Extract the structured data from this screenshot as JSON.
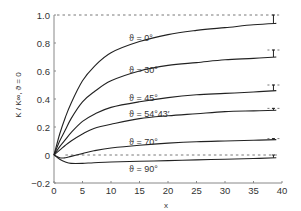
{
  "chart_data": {
    "type": "line",
    "title": "",
    "xlabel": "x",
    "ylabel": "K / K∞, ϑ = 0",
    "xlim": [
      0,
      40
    ],
    "ylim": [
      -0.2,
      1.0
    ],
    "xticks": [
      0,
      5,
      10,
      15,
      20,
      25,
      30,
      35,
      40
    ],
    "xtick_labels": [
      "0",
      "5",
      "10",
      "15",
      "20",
      "25",
      "30",
      "35",
      "40"
    ],
    "yticks": [
      -0.2,
      0,
      0.2,
      0.4,
      0.6,
      0.8,
      1.0
    ],
    "ytick_labels": [
      "−0.2",
      "0",
      "0.2",
      "0.4",
      "0.6",
      "0.8",
      "1.0"
    ],
    "grid": false,
    "legend": "inline labels",
    "reference_lines": [
      {
        "y": 1.0,
        "style": "dashed"
      },
      {
        "y": 0.0,
        "style": "dashed",
        "x_start": 2
      }
    ],
    "series": [
      {
        "name": "ϑ = 0°",
        "label": "ϑ = 0°",
        "asymptote": 1.0,
        "x": [
          0,
          1,
          2,
          3,
          5,
          7,
          10,
          15,
          20,
          25,
          30,
          35,
          39
        ],
        "y": [
          0,
          0.15,
          0.27,
          0.37,
          0.53,
          0.63,
          0.73,
          0.81,
          0.86,
          0.89,
          0.91,
          0.93,
          0.94
        ]
      },
      {
        "name": "ϑ = 30°",
        "label": "ϑ = 30°",
        "asymptote": 0.75,
        "x": [
          0,
          1,
          2,
          3,
          5,
          7,
          10,
          15,
          20,
          25,
          30,
          35,
          39
        ],
        "y": [
          0,
          0.1,
          0.18,
          0.26,
          0.38,
          0.45,
          0.53,
          0.6,
          0.64,
          0.66,
          0.68,
          0.69,
          0.7
        ]
      },
      {
        "name": "ϑ = 45°",
        "label": "ϑ = 45°",
        "asymptote": 0.5,
        "x": [
          0,
          1,
          2,
          3,
          5,
          7,
          10,
          15,
          20,
          25,
          30,
          35,
          39
        ],
        "y": [
          0,
          0.06,
          0.11,
          0.16,
          0.24,
          0.29,
          0.34,
          0.38,
          0.41,
          0.43,
          0.44,
          0.45,
          0.46
        ]
      },
      {
        "name": "ϑ = 54°43′",
        "label": "ϑ = 54°43′",
        "asymptote": 0.333,
        "x": [
          0,
          1,
          2,
          3,
          5,
          7,
          10,
          15,
          20,
          25,
          30,
          35,
          39
        ],
        "y": [
          0,
          0.035,
          0.07,
          0.1,
          0.15,
          0.19,
          0.22,
          0.26,
          0.28,
          0.295,
          0.31,
          0.315,
          0.32
        ]
      },
      {
        "name": "ϑ = 70°",
        "label": "ϑ = 70°",
        "asymptote": 0.117,
        "x": [
          0,
          1,
          2,
          3,
          5,
          7,
          10,
          15,
          20,
          25,
          30,
          35,
          39
        ],
        "y": [
          0,
          -0.02,
          -0.02,
          -0.01,
          0.01,
          0.03,
          0.05,
          0.07,
          0.085,
          0.095,
          0.1,
          0.105,
          0.11
        ]
      },
      {
        "name": "ϑ = 90°",
        "label": "ϑ = 90°",
        "asymptote": 0.0,
        "x": [
          0,
          1,
          2,
          3,
          5,
          7,
          10,
          15,
          20,
          25,
          30,
          35,
          39
        ],
        "y": [
          0,
          -0.03,
          -0.05,
          -0.06,
          -0.06,
          -0.055,
          -0.05,
          -0.045,
          -0.04,
          -0.035,
          -0.03,
          -0.025,
          -0.02
        ]
      }
    ]
  },
  "labels": {
    "xlabel": "x",
    "ylabel": "K / K∞, ϑ = 0",
    "curve_0": "ϑ = 0°",
    "curve_30": "ϑ = 30°",
    "curve_45": "ϑ = 45°",
    "curve_54": "ϑ = 54°43′",
    "curve_70": "ϑ = 70°",
    "curve_90": "ϑ = 90°"
  },
  "style": {
    "line_color": "#222222",
    "axis_color": "#888888",
    "dashed_color": "#555555"
  }
}
